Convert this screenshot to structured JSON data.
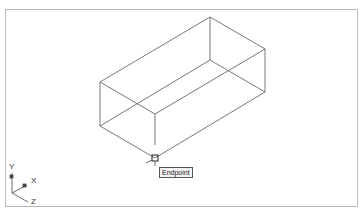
{
  "viewport": {
    "background": "#ffffff",
    "frame_color": "#b8b8b8",
    "line_color": "#555555"
  },
  "model": {
    "type": "wireframe-box",
    "vertices": {
      "top_back": [
        210,
        17
      ],
      "top_right": [
        265,
        49
      ],
      "top_front": [
        155,
        81
      ],
      "top_left": [
        100,
        49
      ],
      "bottom_back": [
        210,
        60
      ],
      "bottom_right": [
        265,
        92
      ],
      "bottom_front": [
        155,
        124
      ],
      "bottom_left": [
        100,
        92
      ]
    }
  },
  "snap": {
    "marker": "endpoint-marker",
    "tooltip": "Endpoint"
  },
  "ucs": {
    "x_label": "X",
    "y_label": "Y",
    "z_label": "Z"
  }
}
